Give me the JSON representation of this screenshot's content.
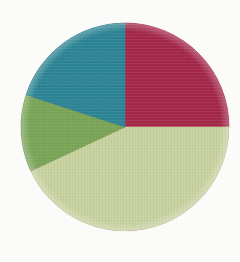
{
  "figure": {
    "background_color": "#fefefd",
    "width": 240,
    "height": 262,
    "texture": "woven-paper"
  },
  "chart_data": {
    "type": "pie",
    "title": "",
    "subtitle": "",
    "xlabel": "",
    "ylabel": "",
    "legend": "none",
    "grid": false,
    "labels_shown": false,
    "start_angle_deg": 0,
    "direction": "clockwise",
    "center": {
      "x": 125,
      "y": 127
    },
    "radius": 104,
    "categories": [
      "Crimson",
      "Pale Sage",
      "Medium Green",
      "Teal"
    ],
    "values": [
      25,
      43,
      12,
      20
    ],
    "slices": [
      {
        "name": "Crimson",
        "value": 25,
        "percent": "25%",
        "color": "#a6264a",
        "start_angle_deg": 0,
        "end_angle_deg": 90
      },
      {
        "name": "Pale Sage",
        "value": 43,
        "percent": "43%",
        "color": "#c9d4a0",
        "start_angle_deg": 90,
        "end_angle_deg": 245
      },
      {
        "name": "Medium Green",
        "value": 12,
        "percent": "12%",
        "color": "#7aa657",
        "start_angle_deg": 245,
        "end_angle_deg": 288
      },
      {
        "name": "Teal",
        "value": 20,
        "percent": "20%",
        "color": "#2a8596",
        "start_angle_deg": 288,
        "end_angle_deg": 360
      }
    ]
  }
}
